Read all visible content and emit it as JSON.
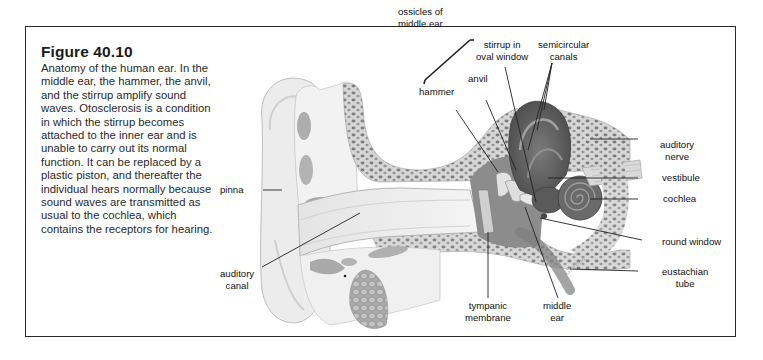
{
  "figure": {
    "title": "Figure 40.10",
    "caption": "Anatomy of the human ear. In the middle ear, the hammer, the anvil, and the stirrup amplify sound waves. Otosclerosis is a condition in which the stirrup becomes attached to the inner ear and is unable to carry out its normal function. It can be replaced by a plastic piston, and thereafter the individual hears normally because sound waves are transmitted as usual to the cochlea, which contains the receptors for hearing."
  },
  "labels": {
    "ossicles": [
      "ossicles of",
      "middle ear"
    ],
    "stirrup": [
      "stirrup in",
      "oval window"
    ],
    "semicircular": [
      "semicircular",
      "canals"
    ],
    "anvil": "anvil",
    "hammer": "hammer",
    "auditory_nerve": [
      "auditory",
      "nerve"
    ],
    "vestibule": "vestibule",
    "cochlea": "cochlea",
    "round_window": "round window",
    "eustachian": [
      "eustachian",
      "tube"
    ],
    "pinna": "pinna",
    "auditory_canal": [
      "auditory",
      "canal"
    ],
    "tympanic": [
      "tympanic",
      "membrane"
    ],
    "middle_ear": [
      "middle",
      "ear"
    ]
  },
  "artist_signature": "Gierhan",
  "colors": {
    "skin": "#ebebeb",
    "bone_dots": "#8a8a8a",
    "inner_ear": "#5f5f5f",
    "border": "#2a2a2a"
  }
}
